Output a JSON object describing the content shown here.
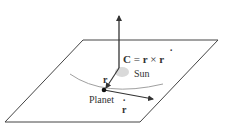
{
  "diagram": {
    "equation": {
      "c": "C",
      "eq": " = ",
      "r": "r",
      "times": " × ",
      "rdot": "r",
      "dot": "·"
    },
    "labels": {
      "sun": "Sun",
      "planet": "Planet",
      "r_vector": "r",
      "r_dot_vector": "r",
      "dot": "·"
    },
    "colors": {
      "line": "#333333",
      "orbit": "#999999",
      "sun": "#d6d6d6",
      "background": "#ffffff"
    }
  }
}
